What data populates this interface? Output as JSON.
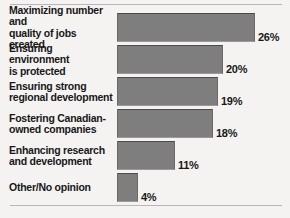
{
  "chart_data": {
    "type": "bar",
    "orientation": "horizontal",
    "title": "",
    "subtitle": "",
    "xlabel": "",
    "ylabel": "",
    "grid": false,
    "legend": null,
    "xlim": [
      0,
      26
    ],
    "unit": "%",
    "categories": [
      "Maximizing number and\nquality of jobs created",
      "Ensuring environment\nis protected",
      "Ensuring strong\nregional development",
      "Fostering Canadian-\nowned companies",
      "Enhancing research\nand development",
      "Other/No opinion"
    ],
    "values": [
      26,
      20,
      19,
      18,
      11,
      4
    ],
    "value_labels": [
      "26%",
      "20%",
      "19%",
      "18%",
      "11%",
      "4%"
    ],
    "colors": {
      "bar_fill": "#7e7e7e",
      "bar_top_edge": "#4a4a4a",
      "background": "#f4f3f1",
      "text": "#181818",
      "rule": "#b9b7b4"
    }
  },
  "rows": [
    {
      "label": "Maximizing number and\nquality of jobs created",
      "value_label": "26%"
    },
    {
      "label": "Ensuring environment\nis protected",
      "value_label": "20%"
    },
    {
      "label": "Ensuring strong\nregional development",
      "value_label": "19%"
    },
    {
      "label": "Fostering Canadian-\nowned companies",
      "value_label": "18%"
    },
    {
      "label": "Enhancing research\nand development",
      "value_label": "11%"
    },
    {
      "label": "Other/No opinion",
      "value_label": "4%"
    }
  ]
}
